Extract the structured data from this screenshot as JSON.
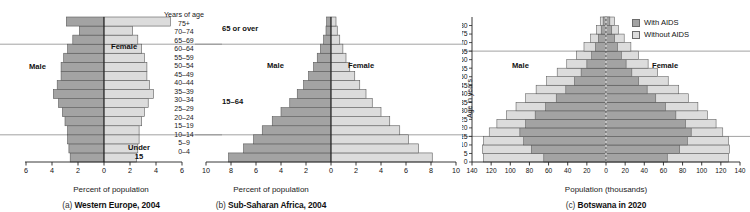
{
  "figure": {
    "shared_age_groups": [
      "0–4",
      "5–9",
      "10–14",
      "15–19",
      "20–24",
      "25–29",
      "30–34",
      "35–39",
      "40–44",
      "45–49",
      "50–54",
      "55–59",
      "60–64",
      "65–69",
      "70–74",
      "75+"
    ],
    "colors": {
      "male_bar": "#a3a3a3",
      "female_bar": "#dcdcdc",
      "with_aids": "#a3a3a3",
      "without_aids": "#dcdcdc",
      "bar_outline": "#5a5a5a",
      "axis": "#222222",
      "divider": "#8a8a8a"
    }
  },
  "panel_a": {
    "caption_prefix": "(a)",
    "caption_title": "Western Europe, 2004",
    "axis_title": "Percent of population",
    "male_label": "Male",
    "female_label": "Female",
    "age_header": "Years of age",
    "bracket_over": "65 or over",
    "bracket_mid": "15–64",
    "bracket_under_line1": "Under",
    "bracket_under_line2": "15",
    "x_ticks": [
      "6",
      "4",
      "2",
      "0",
      "2",
      "4",
      "6"
    ],
    "chart_data": {
      "type": "bar",
      "title": "(a) Western Europe, 2004",
      "xlabel": "Percent of population",
      "ylabel": "Years of age",
      "xlim": [
        -6,
        6
      ],
      "grid": false,
      "legend_position": "inline-labels",
      "categories": [
        "0–4",
        "5–9",
        "10–14",
        "15–19",
        "20–24",
        "25–29",
        "30–34",
        "35–39",
        "40–44",
        "45–49",
        "50–54",
        "55–59",
        "60–64",
        "65–69",
        "70–74",
        "75+"
      ],
      "series": [
        {
          "name": "Male",
          "values": [
            2.6,
            2.7,
            2.8,
            2.8,
            3.0,
            3.2,
            3.5,
            3.9,
            3.6,
            3.3,
            3.3,
            3.1,
            2.8,
            2.4,
            1.9,
            2.9
          ]
        },
        {
          "name": "Female",
          "values": [
            2.5,
            2.6,
            2.7,
            2.7,
            2.9,
            3.1,
            3.4,
            3.8,
            3.5,
            3.3,
            3.3,
            3.1,
            2.9,
            2.6,
            2.2,
            5.1
          ]
        }
      ]
    }
  },
  "panel_b": {
    "caption_prefix": "(b)",
    "caption_title": "Sub-Saharan Africa, 2004",
    "axis_title": "Percent of population",
    "male_label": "Male",
    "female_label": "Female",
    "x_ticks": [
      "10",
      "8",
      "6",
      "4",
      "2",
      "0",
      "2",
      "4",
      "6",
      "8",
      "10"
    ],
    "chart_data": {
      "type": "bar",
      "title": "(b) Sub-Saharan Africa, 2004",
      "xlabel": "Percent of population",
      "ylabel": "Years of age",
      "xlim": [
        -10,
        10
      ],
      "grid": false,
      "legend_position": "inline-labels",
      "categories": [
        "0–4",
        "5–9",
        "10–14",
        "15–19",
        "20–24",
        "25–29",
        "30–34",
        "35–39",
        "40–44",
        "45–49",
        "50–54",
        "55–59",
        "60–64",
        "65–69",
        "70–74",
        "75+"
      ],
      "series": [
        {
          "name": "Male",
          "values": [
            8.2,
            7.0,
            6.2,
            5.5,
            4.7,
            4.0,
            3.3,
            2.7,
            2.2,
            1.8,
            1.4,
            1.1,
            0.85,
            0.6,
            0.4,
            0.35
          ]
        },
        {
          "name": "Female",
          "values": [
            8.1,
            7.0,
            6.2,
            5.5,
            4.7,
            4.0,
            3.3,
            2.8,
            2.3,
            1.9,
            1.5,
            1.2,
            0.95,
            0.7,
            0.5,
            0.4
          ]
        }
      ]
    }
  },
  "panel_c": {
    "caption_prefix": "(c)",
    "caption_title": "Botswana in 2020",
    "axis_title": "Population (thousands)",
    "male_label": "Male",
    "female_label": "Female",
    "y_axis_title": "Age in years",
    "legend": [
      {
        "label": "With AIDS",
        "key": "with_aids"
      },
      {
        "label": "Without AIDS",
        "key": "without_aids"
      }
    ],
    "x_ticks": [
      "140",
      "120",
      "100",
      "80",
      "60",
      "40",
      "20",
      "0",
      "20",
      "40",
      "60",
      "80",
      "100",
      "120",
      "140"
    ],
    "y_ticks": [
      "0",
      "5",
      "10",
      "15",
      "20",
      "25",
      "30",
      "35",
      "40",
      "45",
      "50",
      "55",
      "60",
      "65",
      "70",
      "75",
      "80"
    ],
    "chart_data": {
      "type": "bar",
      "title": "(c) Botswana in 2020",
      "xlabel": "Population (thousands)",
      "ylabel": "Age in years",
      "xlim": [
        -140,
        140
      ],
      "grid": false,
      "legend_position": "top-right",
      "categories": [
        "0",
        "5",
        "10",
        "15",
        "20",
        "25",
        "30",
        "35",
        "40",
        "45",
        "50",
        "55",
        "60",
        "65",
        "70",
        "75",
        "80"
      ],
      "series": [
        {
          "name": "Male without AIDS",
          "values": [
            128,
            129,
            128,
            122,
            114,
            104,
            94,
            84,
            73,
            62,
            51,
            41,
            31,
            23,
            16,
            10,
            6
          ]
        },
        {
          "name": "Male with AIDS",
          "values": [
            65,
            78,
            86,
            90,
            84,
            74,
            63,
            52,
            42,
            33,
            26,
            20,
            15,
            11,
            8,
            5,
            3
          ]
        },
        {
          "name": "Female without AIDS",
          "values": [
            128,
            129,
            128,
            122,
            115,
            106,
            96,
            86,
            76,
            65,
            54,
            44,
            34,
            26,
            19,
            13,
            9
          ]
        },
        {
          "name": "Female with AIDS",
          "values": [
            64,
            77,
            85,
            89,
            83,
            73,
            62,
            52,
            43,
            34,
            27,
            21,
            16,
            12,
            9,
            6,
            4
          ]
        }
      ]
    }
  }
}
